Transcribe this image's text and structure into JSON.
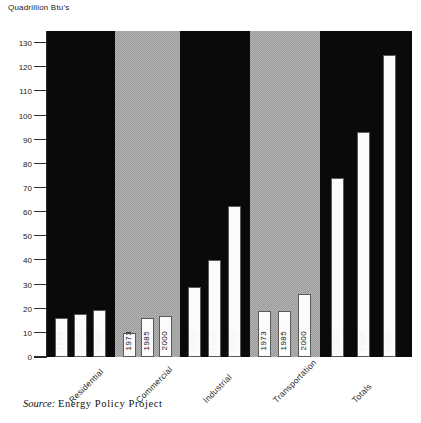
{
  "chart_data": {
    "type": "bar",
    "title": "",
    "subtitle": "",
    "ylabel": "Quadrillion Btu's",
    "xlabel": "",
    "ylim": [
      0,
      135
    ],
    "yticks": [
      0,
      10,
      20,
      30,
      40,
      50,
      60,
      70,
      80,
      90,
      100,
      110,
      120,
      130
    ],
    "grid": false,
    "legend": "none",
    "categories": [
      "Residential",
      "Commercial",
      "Industrial",
      "Transportation",
      "Totals"
    ],
    "series": [
      {
        "name": "1973",
        "values": [
          16,
          10,
          29,
          19,
          74
        ]
      },
      {
        "name": "1985",
        "values": [
          18,
          16,
          40,
          19,
          93
        ]
      },
      {
        "name": "2000",
        "values": [
          19.5,
          17,
          62.5,
          26,
          125
        ]
      }
    ],
    "groups": [
      {
        "label": "Residential",
        "panel": "dark",
        "bars": [
          {
            "year": "1973",
            "value": 16
          },
          {
            "year": "1985",
            "value": 18
          },
          {
            "year": "2000",
            "value": 19.5
          }
        ]
      },
      {
        "label": "Commercial",
        "panel": "light",
        "bars": [
          {
            "year": "1973",
            "value": 10
          },
          {
            "year": "1985",
            "value": 16
          },
          {
            "year": "2000",
            "value": 17
          }
        ]
      },
      {
        "label": "Industrial",
        "panel": "dark",
        "bars": [
          {
            "year": "1973",
            "value": 29
          },
          {
            "year": "1985",
            "value": 40
          },
          {
            "year": "2000",
            "value": 62.5
          }
        ]
      },
      {
        "label": "Transportation",
        "panel": "light",
        "bars": [
          {
            "year": "1973",
            "value": 19
          },
          {
            "year": "1985",
            "value": 19
          },
          {
            "year": "2000",
            "value": 26
          }
        ]
      },
      {
        "label": "Totals",
        "panel": "dark",
        "bars": [
          {
            "year": "1973",
            "value": 74
          },
          {
            "year": "1985",
            "value": 93
          },
          {
            "year": "2000",
            "value": 125
          }
        ]
      }
    ],
    "colors": {
      "bar_fill": "#fbfbfb",
      "bar_edge": "#5a5a5a",
      "panel_dark": "#0a0a0a",
      "panel_light": "#a8a8a8",
      "text": "#1a1a1a",
      "background": "#ffffff"
    }
  },
  "source": {
    "prefix": "Source:",
    "text": "Energy Policy Project"
  }
}
